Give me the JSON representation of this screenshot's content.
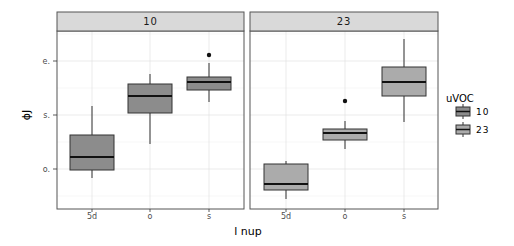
{
  "chart_data": {
    "type": "boxplot",
    "title": "",
    "xlabel": "l nup",
    "ylabel": "ϕJ",
    "y_ticks": [
      {
        "label": "o.",
        "y_px": 169
      },
      {
        "label": "s.",
        "y_px": 115
      },
      {
        "label": "e.",
        "y_px": 61
      }
    ],
    "x_categories": [
      "5d",
      "o",
      "s"
    ],
    "grid": true,
    "legend": {
      "title": "uVOC",
      "position": "right",
      "entries": [
        {
          "label": "10",
          "color": "#8c8c8c"
        },
        {
          "label": "23",
          "color": "#ababab"
        }
      ]
    },
    "facets": [
      {
        "label": "10",
        "fill": "#8c8c8c",
        "boxes": [
          {
            "category": "5d",
            "whisker_low": -0.16,
            "q1": -0.02,
            "median": 0.22,
            "q3": 0.63,
            "whisker_high": 1.15,
            "outliers": []
          },
          {
            "category": "o",
            "whisker_low": 0.45,
            "q1": 1.04,
            "median": 1.35,
            "q3": 1.67,
            "whisker_high": 1.77,
            "outliers": []
          },
          {
            "category": "s",
            "whisker_low": 1.24,
            "q1": 1.46,
            "median": 1.61,
            "q3": 1.7,
            "whisker_high": 1.96,
            "outliers": [
              2.11
            ]
          }
        ]
      },
      {
        "label": "23",
        "fill": "#ababab",
        "boxes": [
          {
            "category": "5d",
            "whisker_low": -0.56,
            "q1": -0.39,
            "median": -0.28,
            "q3": 0.09,
            "whisker_high": 0.15,
            "outliers": []
          },
          {
            "category": "o",
            "whisker_low": 0.37,
            "q1": 0.54,
            "median": 0.67,
            "q3": 0.74,
            "whisker_high": 0.89,
            "outliers": [
              1.26
            ]
          },
          {
            "category": "s",
            "whisker_low": 0.87,
            "q1": 1.35,
            "median": 1.61,
            "q3": 1.87,
            "whisker_high": 2.39,
            "outliers": []
          }
        ]
      }
    ]
  },
  "layout": {
    "panels": [
      {
        "x0": 57,
        "x1": 244,
        "cx": [
          92,
          150,
          209
        ]
      },
      {
        "x0": 250,
        "x1": 438,
        "cx": [
          286,
          345,
          404
        ]
      }
    ],
    "strip_top": 12,
    "plot_top": 31,
    "plot_bottom": 209,
    "box_half_width": 22,
    "px": {
      "panel10": [
        {
          "wt": 106,
          "q3": 135,
          "med": 157,
          "q1": 170,
          "wb": 178,
          "out": []
        },
        {
          "wt": 74,
          "q3": 84,
          "med": 96,
          "q1": 113,
          "wb": 144,
          "out": []
        },
        {
          "wt": 63,
          "q3": 77,
          "med": 82,
          "q1": 90,
          "wb": 102,
          "out": [
            55
          ]
        }
      ],
      "panel23": [
        {
          "wt": 161,
          "q3": 164,
          "med": 184,
          "q1": 190,
          "wb": 199,
          "out": []
        },
        {
          "wt": 121,
          "q3": 129,
          "med": 133,
          "q1": 140,
          "wb": 149,
          "out": [
            101
          ]
        },
        {
          "wt": 39,
          "q3": 67,
          "med": 82,
          "q1": 96,
          "wb": 122,
          "out": []
        }
      ]
    }
  }
}
